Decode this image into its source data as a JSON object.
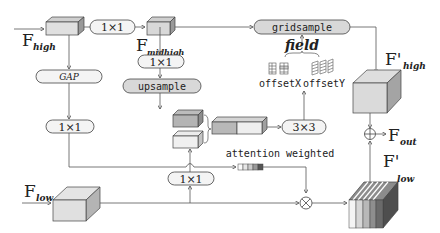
{
  "diagram": {
    "inputs": {
      "f_high": {
        "symbol": "F",
        "sub": "high"
      },
      "f_low": {
        "symbol": "F",
        "sub": "low"
      }
    },
    "intermediate": {
      "f_midhigh": {
        "symbol": "F",
        "sub": "midhigh"
      }
    },
    "outputs": {
      "f_high_prime": {
        "symbol": "F'",
        "sub": "high"
      },
      "f_low_prime": {
        "symbol": "F'",
        "sub": "low"
      },
      "f_out": {
        "symbol": "F",
        "sub": "out"
      }
    },
    "ops": {
      "conv_top": "1×1",
      "gap": "GAP",
      "conv_left": "1×1",
      "conv_mid": "1×1",
      "upsample": "upsample",
      "gridsample": "gridsample",
      "conv3": "3×3",
      "conv_bottom": "1×1"
    },
    "labels": {
      "field": "field",
      "offset_x": "offsetX",
      "offset_y": "offsetY",
      "attention": "attention weighted"
    },
    "colors": {
      "box_fill": "#e4e4e4",
      "box_dark": "#a8a8a8",
      "pill_fill": "#f4f4f4",
      "pill_shaded": "#d8d8d8",
      "line": "#555555",
      "stripe_colors": [
        "#f0f0f0",
        "#d0d0d0",
        "#b0b0b0",
        "#8a8a8a",
        "#606060"
      ]
    }
  }
}
